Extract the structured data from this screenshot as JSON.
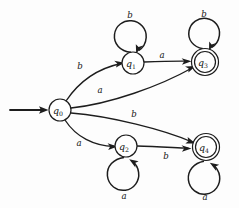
{
  "diagram": {
    "kind": "finite-state-automaton",
    "title": "",
    "alphabet": [
      "a",
      "b"
    ],
    "start_state": "q0",
    "accepting_states": [
      "q3",
      "q4"
    ],
    "states": [
      {
        "id": "q0",
        "label": "q",
        "subscript": "0",
        "cx": 60,
        "cy": 110,
        "r": 11,
        "accepting": false,
        "start": true
      },
      {
        "id": "q1",
        "label": "q",
        "subscript": "1",
        "cx": 133,
        "cy": 63,
        "r": 11,
        "accepting": false,
        "start": false
      },
      {
        "id": "q2",
        "label": "q",
        "subscript": "2",
        "cx": 126,
        "cy": 146,
        "r": 11,
        "accepting": false,
        "start": false
      },
      {
        "id": "q3",
        "label": "q",
        "subscript": "3",
        "cx": 205,
        "cy": 62,
        "r": 10.5,
        "r_outer": 13.5,
        "accepting": true,
        "start": false
      },
      {
        "id": "q4",
        "label": "q",
        "subscript": "4",
        "cx": 206,
        "cy": 147,
        "r": 10.5,
        "r_outer": 13.5,
        "accepting": true,
        "start": false
      }
    ],
    "transitions": [
      {
        "id": "t-q0-q1",
        "from": "q0",
        "to": "q1",
        "symbol": "b",
        "label_x": 80,
        "label_y": 66
      },
      {
        "id": "t-q0-q3",
        "from": "q0",
        "to": "q3",
        "symbol": "a",
        "label_x": 100,
        "label_y": 90
      },
      {
        "id": "t-q0-q4",
        "from": "q0",
        "to": "q4",
        "symbol": "b",
        "label_x": 134,
        "label_y": 114
      },
      {
        "id": "t-q0-q2",
        "from": "q0",
        "to": "q2",
        "symbol": "a",
        "label_x": 79,
        "label_y": 143
      },
      {
        "id": "t-q1-q3",
        "from": "q1",
        "to": "q3",
        "symbol": "a",
        "label_x": 162,
        "label_y": 55
      },
      {
        "id": "t-q2-q4",
        "from": "q2",
        "to": "q4",
        "symbol": "b",
        "label_x": 166,
        "label_y": 156
      },
      {
        "id": "t-q1-q1",
        "from": "q1",
        "to": "q1",
        "symbol": "b",
        "self": true,
        "label_x": 130,
        "label_y": 15
      },
      {
        "id": "t-q3-q3",
        "from": "q3",
        "to": "q3",
        "symbol": "b",
        "label_x": 204,
        "label_y": 14,
        "self": true
      },
      {
        "id": "t-q2-q2",
        "from": "q2",
        "to": "q2",
        "symbol": "a",
        "label_x": 124,
        "label_y": 196,
        "self": true
      },
      {
        "id": "t-q4-q4",
        "from": "q4",
        "to": "q4",
        "symbol": "a",
        "label_x": 205,
        "label_y": 197,
        "self": true
      }
    ],
    "start_arrow": {
      "x1": 10,
      "y1": 110,
      "x2": 47,
      "y2": 110
    },
    "colors": {
      "ink": "#1d1d1d",
      "paper": "#fdfdfd"
    }
  }
}
